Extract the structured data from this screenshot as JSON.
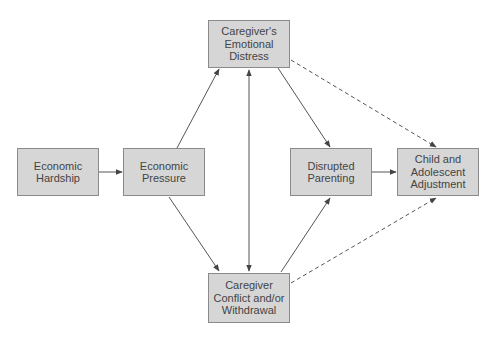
{
  "diagram": {
    "type": "path-model",
    "nodes": {
      "economic_hardship": {
        "label": "Economic\nHardship"
      },
      "economic_pressure": {
        "label": "Economic\nPressure"
      },
      "emotional_distress": {
        "label": "Caregiver's\nEmotional\nDistress"
      },
      "conflict_withdrawal": {
        "label": "Caregiver\nConflict and/or\nWithdrawal"
      },
      "disrupted_parenting": {
        "label": "Disrupted\nParenting"
      },
      "child_adjustment": {
        "label": "Child and\nAdolescent\nAdjustment"
      }
    },
    "edges": [
      {
        "from": "economic_hardship",
        "to": "economic_pressure",
        "style": "solid"
      },
      {
        "from": "economic_pressure",
        "to": "emotional_distress",
        "style": "solid"
      },
      {
        "from": "economic_pressure",
        "to": "conflict_withdrawal",
        "style": "solid"
      },
      {
        "from": "emotional_distress",
        "to": "conflict_withdrawal",
        "style": "solid",
        "bidirectional": true
      },
      {
        "from": "emotional_distress",
        "to": "disrupted_parenting",
        "style": "solid"
      },
      {
        "from": "conflict_withdrawal",
        "to": "disrupted_parenting",
        "style": "solid"
      },
      {
        "from": "disrupted_parenting",
        "to": "child_adjustment",
        "style": "solid"
      },
      {
        "from": "emotional_distress",
        "to": "child_adjustment",
        "style": "dashed"
      },
      {
        "from": "conflict_withdrawal",
        "to": "child_adjustment",
        "style": "dashed"
      }
    ],
    "colors": {
      "box_fill": "#d6d6d6",
      "box_border": "#8a8a8a",
      "arrow": "#555555",
      "text": "#444444"
    }
  }
}
